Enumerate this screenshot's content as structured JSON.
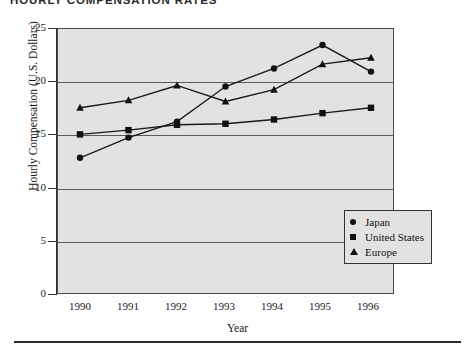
{
  "title": "HOURLY COMPENSATION RATES",
  "legend": {
    "items": [
      {
        "label": "Japan",
        "marker": "circle-marker-icon"
      },
      {
        "label": "United States",
        "marker": "square-marker-icon"
      },
      {
        "label": "Europe",
        "marker": "triangle-marker-icon"
      }
    ]
  },
  "chart_data": {
    "type": "line",
    "title": "HOURLY COMPENSATION RATES",
    "xlabel": "Year",
    "ylabel": "Hourly Compensation (U.S. Dollars)",
    "categories": [
      "1990",
      "1991",
      "1992",
      "1993",
      "1994",
      "1995",
      "1996"
    ],
    "x": [
      1990,
      1991,
      1992,
      1993,
      1994,
      1995,
      1996
    ],
    "ylim": [
      0,
      25
    ],
    "yticks": [
      0,
      5,
      10,
      15,
      20,
      25
    ],
    "ytick_labels": [
      "0",
      "5",
      "10",
      "15",
      "20",
      "25"
    ],
    "grid": true,
    "legend_position": "inside-lower-right",
    "series": [
      {
        "name": "Japan",
        "marker": "circle",
        "values": [
          12.8,
          14.7,
          16.2,
          19.5,
          21.2,
          23.4,
          20.9
        ]
      },
      {
        "name": "United States",
        "marker": "square",
        "values": [
          15.0,
          15.4,
          15.9,
          16.0,
          16.4,
          17.0,
          17.5
        ]
      },
      {
        "name": "Europe",
        "marker": "triangle",
        "values": [
          17.5,
          18.2,
          19.6,
          18.1,
          19.2,
          21.6,
          22.2
        ]
      }
    ]
  }
}
